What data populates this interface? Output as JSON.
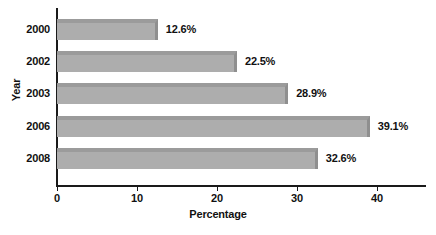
{
  "chart_data": {
    "type": "bar",
    "orientation": "horizontal",
    "title": "",
    "xlabel": "Percentage",
    "ylabel": "Year",
    "categories": [
      "2000",
      "2002",
      "2003",
      "2006",
      "2008"
    ],
    "values": [
      12.6,
      22.5,
      28.9,
      39.1,
      32.6
    ],
    "data_labels": [
      "12.6%",
      "22.5%",
      "28.9%",
      "39.1%",
      "32.6%"
    ],
    "xticks": [
      "0",
      "10",
      "20",
      "30",
      "40"
    ],
    "xtick_values": [
      0,
      10,
      20,
      30,
      40
    ],
    "xlim": [
      0,
      40
    ],
    "grid": false,
    "legend": null,
    "bar_color": "#adadad",
    "bar_edge_color": "#8f8f8f",
    "axis_color": "#1a1a1a",
    "background_color": "#ffffff"
  }
}
